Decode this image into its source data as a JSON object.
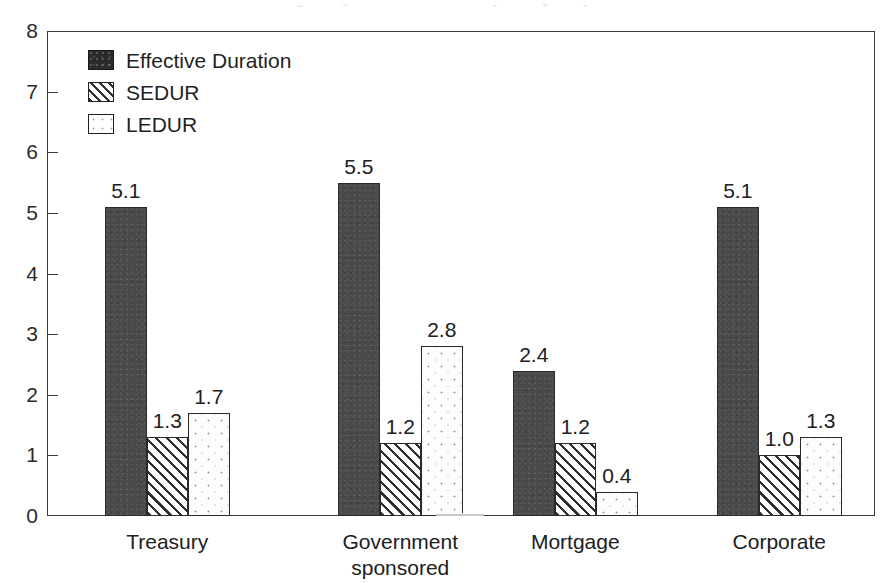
{
  "chart_data": {
    "type": "bar",
    "title": "",
    "xlabel": "",
    "ylabel": "",
    "ylim": [
      0,
      8
    ],
    "yticks": [
      "0",
      "1",
      "2",
      "3",
      "4",
      "5",
      "6",
      "7",
      "8"
    ],
    "grid": false,
    "legend_position": "top-left inside plot",
    "categories": [
      "Treasury",
      "Government\nsponsored",
      "Mortgage",
      "Corporate"
    ],
    "series": [
      {
        "name": "Effective Duration",
        "fill": "solid-dark",
        "color": "#4a4a4a",
        "values": [
          5.1,
          5.5,
          2.4,
          5.1
        ],
        "labels": [
          "5.1",
          "5.5",
          "2.4",
          "5.1"
        ]
      },
      {
        "name": "SEDUR",
        "fill": "diagonal-hatch",
        "color": "#ffffff",
        "values": [
          1.3,
          1.2,
          1.2,
          1.0
        ],
        "labels": [
          "1.3",
          "1.2",
          "1.2",
          "1.0"
        ]
      },
      {
        "name": "LEDUR",
        "fill": "dotted",
        "color": "#fdfdfd",
        "values": [
          1.7,
          2.8,
          0.4,
          1.3
        ],
        "labels": [
          "1.7",
          "2.8",
          "0.4",
          "1.3"
        ]
      }
    ]
  },
  "legend": {
    "items": [
      {
        "label": "Effective Duration",
        "fill": "solid"
      },
      {
        "label": "SEDUR",
        "fill": "hatch"
      },
      {
        "label": "LEDUR",
        "fill": "dots"
      }
    ]
  },
  "axis": {
    "y_labels": [
      "8",
      "7",
      "6",
      "5",
      "4",
      "3",
      "2",
      "1",
      "0"
    ]
  },
  "categories": [
    {
      "line1": "Treasury",
      "line2": ""
    },
    {
      "line1": "Government",
      "line2": "sponsored"
    },
    {
      "line1": "Mortgage",
      "line2": ""
    },
    {
      "line1": "Corporate",
      "line2": ""
    }
  ]
}
